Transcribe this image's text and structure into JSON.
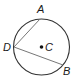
{
  "diagram": {
    "type": "circle-with-chords",
    "circle": {
      "center_label": "C",
      "cx": 41.5,
      "cy": 47,
      "r": 28
    },
    "points": [
      {
        "label": "A",
        "x": 40,
        "y": 19,
        "label_x": 37,
        "label_y": 13
      },
      {
        "label": "B",
        "x": 63,
        "y": 65,
        "label_x": 63,
        "label_y": 75
      },
      {
        "label": "D",
        "x": 14,
        "y": 47,
        "label_x": 3,
        "label_y": 51
      },
      {
        "label": "C",
        "x": 41.5,
        "y": 47,
        "label_x": 45,
        "label_y": 51
      }
    ],
    "segments": [
      {
        "from": "D",
        "to": "A"
      },
      {
        "from": "D",
        "to": "B"
      }
    ],
    "colors": {
      "circle": "#333333",
      "chord": "#777777",
      "label": "#1a1a1a"
    }
  }
}
